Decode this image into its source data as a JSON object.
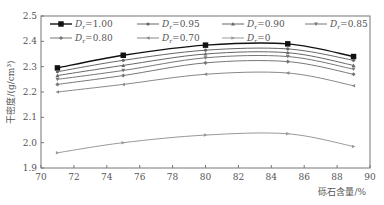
{
  "chart_data": {
    "type": "line",
    "title": "",
    "xlabel": "砾石含量/%",
    "ylabel": "干密度/(g/cm³)",
    "xlim": [
      70,
      90
    ],
    "ylim": [
      1.9,
      2.5
    ],
    "xticks": [
      70,
      72,
      74,
      76,
      78,
      80,
      82,
      84,
      86,
      88,
      90
    ],
    "yticks": [
      1.9,
      2.0,
      2.1,
      2.2,
      2.3,
      2.4,
      2.5
    ],
    "x": [
      71,
      75,
      80,
      85,
      89
    ],
    "legend_position": "top-left inside, 4 columns",
    "grid": false,
    "series": [
      {
        "name": "Dr=1.00",
        "sub": "r",
        "label_val": "1.00",
        "marker": "square",
        "color": "#111111",
        "values": [
          2.295,
          2.345,
          2.385,
          2.39,
          2.34
        ]
      },
      {
        "name": "Dr=0.95",
        "sub": "r",
        "label_val": "0.95",
        "marker": "circle",
        "color": "#666666",
        "values": [
          2.28,
          2.325,
          2.365,
          2.37,
          2.325
        ]
      },
      {
        "name": "Dr=0.90",
        "sub": "r",
        "label_val": "0.90",
        "marker": "triangle-up",
        "color": "#666666",
        "values": [
          2.265,
          2.305,
          2.35,
          2.355,
          2.305
        ]
      },
      {
        "name": "Dr=0.85",
        "sub": "r",
        "label_val": "0.85",
        "marker": "triangle-down",
        "color": "#777777",
        "values": [
          2.25,
          2.285,
          2.335,
          2.34,
          2.29
        ]
      },
      {
        "name": "Dr=0.80",
        "sub": "r",
        "label_val": "0.80",
        "marker": "diamond",
        "color": "#777777",
        "values": [
          2.23,
          2.265,
          2.315,
          2.32,
          2.27
        ]
      },
      {
        "name": "Dr=0.70",
        "sub": "r",
        "label_val": "0.70",
        "marker": "triangle-left",
        "color": "#888888",
        "values": [
          2.2,
          2.23,
          2.27,
          2.275,
          2.225
        ]
      },
      {
        "name": "Dr=0",
        "sub": "r",
        "label_val": "0",
        "marker": "triangle-right",
        "color": "#999999",
        "values": [
          1.96,
          2.0,
          2.03,
          2.035,
          1.985
        ]
      }
    ]
  }
}
